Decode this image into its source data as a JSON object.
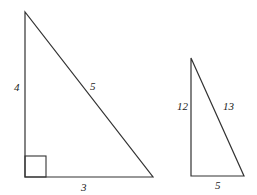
{
  "diagram": {
    "stroke_color": "#333333",
    "triangles": [
      {
        "name": "triangle-3-4-5",
        "vertices": [
          [
            25,
            12
          ],
          [
            25,
            177
          ],
          [
            153,
            177
          ]
        ],
        "right_angle_marker": {
          "x": 25,
          "y": 156,
          "size": 21
        },
        "labels": {
          "vertical_leg": "4",
          "hypotenuse": "5",
          "horizontal_leg": "3"
        }
      },
      {
        "name": "triangle-5-12-13",
        "vertices": [
          [
            191,
            58
          ],
          [
            191,
            176
          ],
          [
            244,
            176
          ]
        ],
        "labels": {
          "vertical_leg": "12",
          "hypotenuse": "13",
          "horizontal_leg": "5"
        }
      }
    ]
  }
}
